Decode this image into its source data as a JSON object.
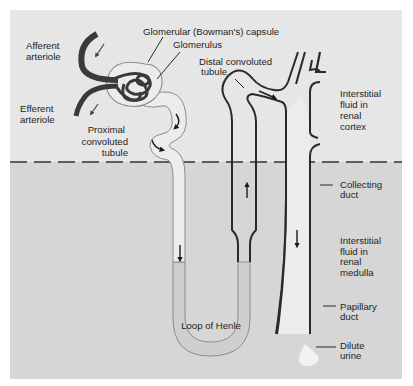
{
  "diagram": {
    "colors": {
      "page_background": "#ffffff",
      "cortex_background": "#e6e6e6",
      "medulla_background": "#d5d5d5",
      "tubule_fill": "#ececec",
      "loop_fill": "#cfcfcf",
      "outline_dark": "#333333",
      "outline_light": "#8c8c8c",
      "vessel": "#3a3a3a",
      "arrow": "#1a1a1a"
    },
    "regions": {
      "cortex_label": "Interstitial fluid in renal cortex",
      "medulla_label": "Interstitial fluid in renal medulla"
    },
    "labels": {
      "afferent_1": "Afferent",
      "afferent_2": "arteriole",
      "efferent_1": "Efferent",
      "efferent_2": "arteriole",
      "bowman": "Glomerular (Bowman's) capsule",
      "glomerulus": "Glomerulus",
      "distal_1": "Distal convoluted",
      "distal_2": "tubule",
      "proximal_1": "Proximal",
      "proximal_2": "convoluted",
      "proximal_3": "tubule",
      "cortex_1": "Interstitial",
      "cortex_2": "fluid in",
      "cortex_3": "renal",
      "cortex_4": "cortex",
      "collecting_1": "Collecting",
      "collecting_2": "duct",
      "medulla_1": "Interstitial",
      "medulla_2": "fluid in",
      "medulla_3": "renal",
      "medulla_4": "medulla",
      "papillary_1": "Papillary",
      "papillary_2": "duct",
      "loop": "Loop of Henle",
      "urine_1": "Dilute",
      "urine_2": "urine"
    },
    "icons": [
      "flow-arrow-afferent",
      "flow-arrow-efferent",
      "flow-arrow-proximal-1",
      "flow-arrow-proximal-2",
      "flow-arrow-descending-limb",
      "flow-arrow-ascending-limb",
      "flow-arrow-distal",
      "flow-arrow-collecting-duct"
    ]
  }
}
